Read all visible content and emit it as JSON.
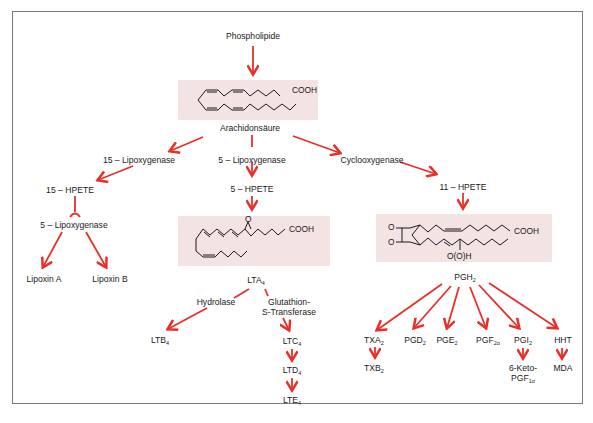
{
  "diagram": {
    "type": "biochemical-pathway",
    "colors": {
      "arrow": "#e8302a",
      "box": "#f3e3e3",
      "text": "#1a1a1a",
      "frame": "#7a7a7a"
    },
    "nodes": {
      "phospholipide": "Phospholipide",
      "arachidonsaeure": "Arachidonsäure",
      "lox15": "15 – Lipoxygenase",
      "lox5": "5 – Lipoxygenase",
      "cox": "Cyclooxygenase",
      "hpete15": "15 – HPETE",
      "lox5b": "5 – Lipoxygenase",
      "lipoxinA": "Lipoxin A",
      "lipoxinB": "Lipoxin B",
      "hpete5": "5 – HPETE",
      "lta4": {
        "base": "LTA",
        "sub": "4"
      },
      "hydrolase": "Hydrolase",
      "gst1": "Glutathion-",
      "gst2": "S-Transferase",
      "ltb4": {
        "base": "LTB",
        "sub": "4"
      },
      "ltc4": {
        "base": "LTC",
        "sub": "4"
      },
      "ltd4": {
        "base": "LTD",
        "sub": "4"
      },
      "lte4": {
        "base": "LTE",
        "sub": "4"
      },
      "hpete11": "11 – HPETE",
      "pgh2": {
        "base": "PGH",
        "sub": "2"
      },
      "txa2": {
        "base": "TXA",
        "sub": "2"
      },
      "txb2": {
        "base": "TXB",
        "sub": "2"
      },
      "pgd2": {
        "base": "PGD",
        "sub": "2"
      },
      "pge2": {
        "base": "PGE",
        "sub": "2"
      },
      "pgf2a": {
        "base": "PGF",
        "sub": "2α"
      },
      "pgi2": {
        "base": "PGI",
        "sub": "2"
      },
      "keto1": "6-Keto-",
      "keto2": {
        "base": "PGF",
        "sub": "1α"
      },
      "hht": "HHT",
      "mda": "MDA"
    },
    "structures": {
      "arachidonic_acid": {
        "group": "COOH"
      },
      "lta4": {
        "group": "COOH",
        "epoxide": "O"
      },
      "pgh2": {
        "group": "COOH",
        "peroxide": "O",
        "hydroperoxy": "O(O)H"
      }
    },
    "edges": [
      [
        "phospholipide",
        "arachidonsaeure"
      ],
      [
        "arachidonsaeure",
        "lox15"
      ],
      [
        "arachidonsaeure",
        "lox5"
      ],
      [
        "arachidonsaeure",
        "cox"
      ],
      [
        "lox15",
        "hpete15"
      ],
      [
        "hpete15",
        "lox5b"
      ],
      [
        "lox5b",
        "lipoxinA"
      ],
      [
        "lox5b",
        "lipoxinB"
      ],
      [
        "lox5",
        "hpete5"
      ],
      [
        "hpete5",
        "lta4"
      ],
      [
        "lta4",
        "hydrolase"
      ],
      [
        "hydrolase",
        "ltb4"
      ],
      [
        "lta4",
        "gst"
      ],
      [
        "gst",
        "ltc4"
      ],
      [
        "ltc4",
        "ltd4"
      ],
      [
        "ltd4",
        "lte4"
      ],
      [
        "cox",
        "hpete11"
      ],
      [
        "hpete11",
        "pgh2"
      ],
      [
        "pgh2",
        "txa2"
      ],
      [
        "pgh2",
        "pgd2"
      ],
      [
        "pgh2",
        "pge2"
      ],
      [
        "pgh2",
        "pgf2a"
      ],
      [
        "pgh2",
        "pgi2"
      ],
      [
        "pgh2",
        "hht"
      ],
      [
        "txa2",
        "txb2"
      ],
      [
        "pgi2",
        "6-keto-pgf1a"
      ],
      [
        "hht",
        "mda"
      ]
    ]
  }
}
